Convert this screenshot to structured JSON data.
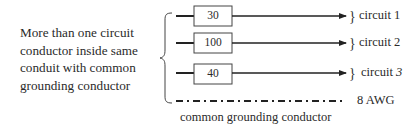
{
  "description": {
    "lines": [
      "More than one circuit",
      "conductor inside same",
      "conduit with common",
      "grounding conductor"
    ]
  },
  "circuits": [
    {
      "box_value": "30",
      "label": "circuit 1"
    },
    {
      "box_value": "100",
      "label": "circuit 2"
    },
    {
      "box_value": "40",
      "label_prefix": "circuit ",
      "label_number": "3"
    }
  ],
  "ground": {
    "size_label": "8 AWG",
    "caption": "common grounding conductor"
  },
  "colors": {
    "stroke": "#222222",
    "text": "#2a2a2a",
    "background": "#ffffff"
  }
}
